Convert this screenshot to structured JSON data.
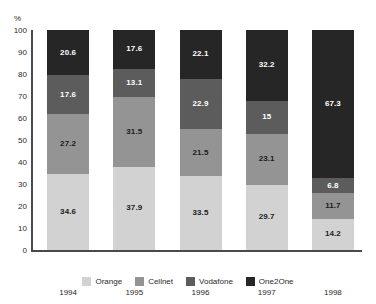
{
  "chart_data": {
    "type": "bar",
    "subtype": "stacked-100-percent",
    "title": "",
    "xlabel": "",
    "ylabel": "%",
    "ylim": [
      0,
      100
    ],
    "yticks": [
      100,
      90,
      80,
      70,
      60,
      50,
      40,
      30,
      20,
      10,
      0
    ],
    "grid": false,
    "legend_position": "bottom-center",
    "stack_order_bottom_to_top": [
      "Orange",
      "Cellnet",
      "Vodafone",
      "One2One"
    ],
    "categories": [
      "1994",
      "1995",
      "1996",
      "1997",
      "1998"
    ],
    "series": [
      {
        "name": "Orange",
        "color": "#d2d2d2",
        "label_color": "#1c1c1c",
        "values": [
          34.6,
          37.9,
          33.5,
          29.7,
          14.2
        ],
        "value_labels": [
          "34.6",
          "37.9",
          "33.5",
          "29.7",
          "14.2"
        ]
      },
      {
        "name": "Cellnet",
        "color": "#949494",
        "label_color": "#1c1c1c",
        "values": [
          27.2,
          31.5,
          21.5,
          23.1,
          11.7
        ],
        "value_labels": [
          "27.2",
          "31.5",
          "21.5",
          "23.1",
          "11.7"
        ]
      },
      {
        "name": "Vodafone",
        "color": "#5c5c5c",
        "label_color": "#ffffff",
        "values": [
          17.6,
          13.1,
          22.9,
          15.0,
          6.8
        ],
        "value_labels": [
          "17.6",
          "13.1",
          "22.9",
          "15",
          "6.8"
        ]
      },
      {
        "name": "One2One",
        "color": "#262626",
        "label_color": "#ffffff",
        "values": [
          20.6,
          17.6,
          22.1,
          32.2,
          67.3
        ],
        "value_labels": [
          "20.6",
          "17.6",
          "22.1",
          "32.2",
          "67.3"
        ]
      }
    ]
  },
  "axis": {
    "unit_label": "%"
  },
  "colors": {
    "background": "#ffffff",
    "axis_line": "#4a4a4a",
    "tick_text": "#2a2a2a"
  }
}
